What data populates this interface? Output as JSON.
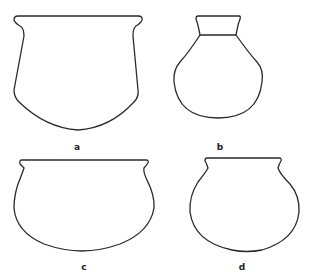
{
  "figure": {
    "stroke_color": "#2a2a2a",
    "background": "#ffffff",
    "vessels": [
      {
        "id": "a",
        "label": "a",
        "shape": "wide-mouthed jar with flaring rim and rounded base"
      },
      {
        "id": "b",
        "label": "b",
        "shape": "globular flask with short cylindrical neck and flared lip"
      },
      {
        "id": "c",
        "label": "c",
        "shape": "shallow wide bowl with everted rim"
      },
      {
        "id": "d",
        "label": "d",
        "shape": "globular pot with everted rim"
      }
    ]
  }
}
